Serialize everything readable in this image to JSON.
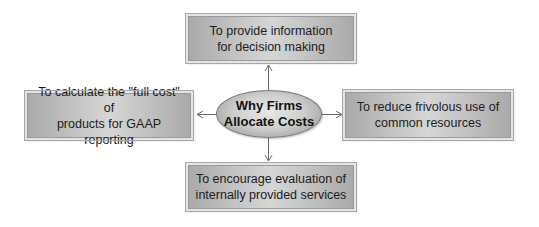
{
  "diagram": {
    "center": {
      "line1": "Why Firms",
      "line2": "Allocate Costs"
    },
    "top": {
      "line1": "To provide information",
      "line2": "for decision making"
    },
    "left": {
      "line1": "To calculate the \"full cost\" of",
      "line2": "products for GAAP reporting"
    },
    "right": {
      "line1": "To reduce frivolous use of",
      "line2": "common resources"
    },
    "bottom": {
      "line1": "To encourage evaluation of",
      "line2": "internally provided services"
    },
    "colors": {
      "box_fill": "#c0c0c0",
      "box_border": "#e4e4e4",
      "ellipse_fill": "#d0d0d0",
      "arrow": "#6a6a6a",
      "text": "#1c1c1c"
    }
  }
}
